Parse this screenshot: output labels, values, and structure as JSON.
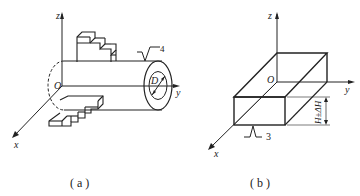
{
  "figure_a": {
    "caption": "( a )",
    "axes": {
      "x": "x",
      "y": "y",
      "z": "z",
      "origin": "O"
    },
    "diameter_label": "D",
    "roughness_label": "4",
    "description": "Cylindrical part with stepped features on top and bottom, positioned in xyz coordinate system, end face with diameter D"
  },
  "figure_b": {
    "caption": "( b )",
    "axes": {
      "x": "x",
      "y": "y",
      "z": "z",
      "origin": "O"
    },
    "height_label": "H±ΔH",
    "roughness_label": "3",
    "description": "Rectangular block positioned in xyz coordinate system with bottom surface roughness 3 and height tolerance H±ΔH"
  }
}
